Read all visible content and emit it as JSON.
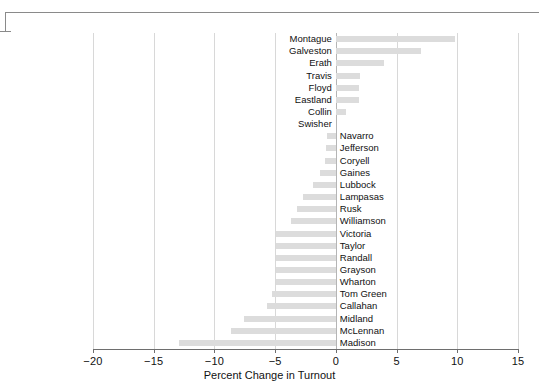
{
  "chart_data": {
    "type": "bar",
    "orientation": "horizontal",
    "title": "",
    "xlabel": "Percent Change in Turnout",
    "ylabel": "",
    "xlim": [
      -20,
      15
    ],
    "xticks": [
      -20,
      -15,
      -10,
      -5,
      0,
      5,
      10,
      15
    ],
    "xticklabels": [
      "−20",
      "−15",
      "−10",
      "−5",
      "0",
      "5",
      "10",
      "15"
    ],
    "grid": "vertical",
    "legend": "none",
    "bar_color": "#dcdcdc",
    "categories": [
      "Montague",
      "Galveston",
      "Erath",
      "Travis",
      "Floyd",
      "Eastland",
      "Collin",
      "Swisher",
      "Navarro",
      "Jefferson",
      "Coryell",
      "Gaines",
      "Lubbock",
      "Lampasas",
      "Rusk",
      "Williamson",
      "Victoria",
      "Taylor",
      "Randall",
      "Grayson",
      "Wharton",
      "Tom Green",
      "Callahan",
      "Midland",
      "McLennan",
      "Madison"
    ],
    "values": [
      9.8,
      7.0,
      4.0,
      2.0,
      1.9,
      1.9,
      0.8,
      0.0,
      -0.7,
      -0.8,
      -0.9,
      -1.3,
      -1.9,
      -2.7,
      -3.2,
      -3.7,
      -4.9,
      -4.9,
      -4.9,
      -4.9,
      -4.9,
      -5.3,
      -5.7,
      -7.6,
      -8.6,
      -12.9
    ]
  },
  "decoration": {
    "top_rule": "horizontal-rule",
    "left_bracket": "axis-bracket"
  }
}
